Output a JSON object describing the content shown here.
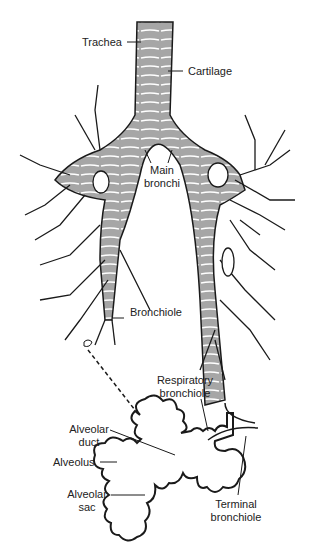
{
  "diagram": {
    "colors": {
      "airway_fill": "#a6a6a6",
      "cartilage_rings": "#ffffff",
      "outline": "#1a1a1a",
      "background": "#ffffff"
    },
    "labels": {
      "trachea": "Trachea",
      "cartilage": "Cartilage",
      "main_bronchi_line1": "Main",
      "main_bronchi_line2": "bronchi",
      "bronchiole": "Bronchiole",
      "respiratory_bronchiole_line1": "Respiratory",
      "respiratory_bronchiole_line2": "bronchiole",
      "alveolar_duct_line1": "Alveolar",
      "alveolar_duct_line2": "duct",
      "alveolus": "Alveolus",
      "alveolar_sac_line1": "Alveolar",
      "alveolar_sac_line2": "sac",
      "terminal_bronchiole_line1": "Terminal",
      "terminal_bronchiole_line2": "bronchiole"
    }
  }
}
